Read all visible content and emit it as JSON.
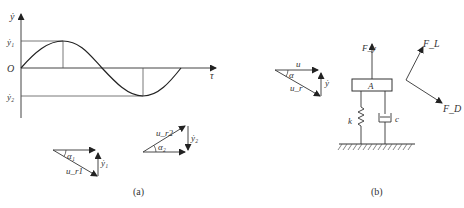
{
  "panel_a": {
    "caption": "(a)",
    "plot": {
      "y_axis_label": "ẏ",
      "x_axis_label": "τ",
      "origin_label": "O",
      "max_label": "ẏ₁",
      "min_label": "ẏ₂"
    },
    "triangle_1": {
      "angle_label": "α₁",
      "hyp_label": "u_r1",
      "vert_label": "ẏ₁"
    },
    "triangle_2": {
      "angle_label": "α₂",
      "hyp_label": "u_r2",
      "vert_label": "ẏ₂"
    }
  },
  "panel_b": {
    "caption": "(b)",
    "triangle": {
      "horiz_label": "u",
      "angle_label": "α",
      "hyp_label": "u_r",
      "vert_label": "ẏ"
    },
    "mass_label": "A",
    "spring_label": "k",
    "damper_label": "c",
    "force_up_label": "F_y",
    "lift_label": "F_L",
    "drag_label": "F_D"
  }
}
